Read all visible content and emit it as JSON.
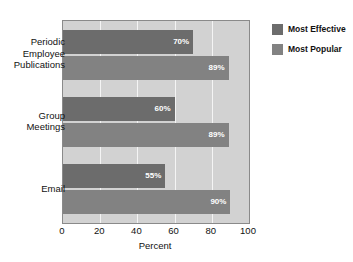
{
  "chart_data": {
    "type": "bar",
    "orientation": "horizontal",
    "title": "",
    "xlabel": "Percent",
    "ylabel": "",
    "xlim": [
      0,
      100
    ],
    "xticks": [
      "0",
      "20",
      "40",
      "60",
      "80",
      "100"
    ],
    "grid": true,
    "legend_position": "top-right",
    "categories": [
      "Periodic Employee Publications",
      "Group Meetings",
      "Email"
    ],
    "category_lines": [
      [
        "Periodic",
        "Employee",
        "Publications"
      ],
      [
        "Group",
        "Meetings"
      ],
      [
        "Email"
      ]
    ],
    "series": [
      {
        "name": "Most Effective",
        "color": "#6c6c6c",
        "values": [
          70,
          60,
          55
        ],
        "labels": [
          "70%",
          "60%",
          "55%"
        ]
      },
      {
        "name": "Most Popular",
        "color": "#828282",
        "values": [
          89,
          89,
          90
        ],
        "labels": [
          "89%",
          "89%",
          "90%"
        ]
      }
    ]
  },
  "legend": {
    "items": [
      {
        "label": "Most Effective",
        "color": "#6c6c6c"
      },
      {
        "label": "Most Popular",
        "color": "#828282"
      }
    ]
  },
  "colors": {
    "plot_background": "#d2d2d2",
    "plot_border": "#8a8a8a",
    "gridline": "#f4f4f4",
    "page_background": "#ffffff",
    "text": "#111111",
    "bar_label_text": "#ffffff"
  }
}
